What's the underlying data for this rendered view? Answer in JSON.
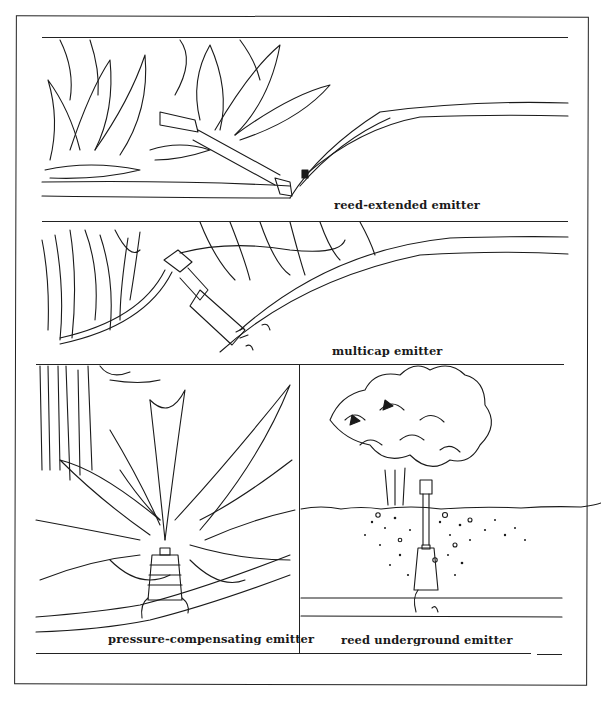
{
  "figure": {
    "header_cutoff": "DRIP IRRIGATION EMITTERS",
    "panels": [
      {
        "id": "reed-extended",
        "caption": "reed-extended emitter"
      },
      {
        "id": "multicap",
        "caption": "multicap emitter"
      },
      {
        "id": "pressure-compensating",
        "caption": "pressure-compensating emitter"
      },
      {
        "id": "reed-underground",
        "caption": "reed underground emitter"
      }
    ]
  },
  "colors": {
    "ink": "#1a1a1a",
    "paper": "#ffffff"
  }
}
